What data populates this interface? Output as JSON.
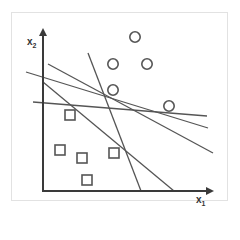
{
  "diagram": {
    "type": "linear-separators-svm",
    "axes": {
      "x_label": "x",
      "x_subscript": "1",
      "y_label": "x",
      "y_subscript": "2"
    },
    "colors": {
      "axis": "#3a3a3a",
      "lines": "#555555",
      "markers": "#555555",
      "frame": "#e2e2e2"
    },
    "class_circles": [
      {
        "cx": 135,
        "cy": 37
      },
      {
        "cx": 113,
        "cy": 64
      },
      {
        "cx": 147,
        "cy": 64
      },
      {
        "cx": 113,
        "cy": 90
      },
      {
        "cx": 169,
        "cy": 106
      }
    ],
    "class_squares": [
      {
        "x": 65,
        "y": 110
      },
      {
        "x": 55,
        "y": 145
      },
      {
        "x": 77,
        "y": 153
      },
      {
        "x": 109,
        "y": 148
      },
      {
        "x": 82,
        "y": 175
      }
    ],
    "separating_lines": [
      {
        "x1": 26,
        "y1": 72,
        "x2": 208,
        "y2": 128
      },
      {
        "x1": 48,
        "y1": 64,
        "x2": 213,
        "y2": 153
      },
      {
        "x1": 33,
        "y1": 102,
        "x2": 207,
        "y2": 116
      },
      {
        "x1": 88,
        "y1": 53,
        "x2": 141,
        "y2": 191
      },
      {
        "x1": 43,
        "y1": 82,
        "x2": 174,
        "y2": 191
      }
    ]
  }
}
